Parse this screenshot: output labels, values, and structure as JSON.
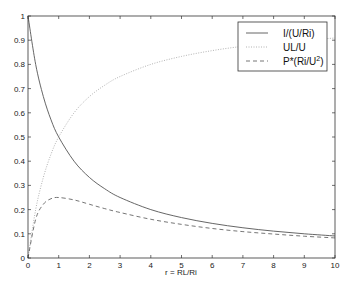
{
  "chart_data": {
    "type": "line",
    "title": "",
    "xlabel": "r = RL/Ri",
    "ylabel": "",
    "xlim": [
      0,
      10
    ],
    "ylim": [
      0,
      1
    ],
    "grid": false,
    "legend_position": "upper right",
    "x_ticks": [
      0,
      1,
      2,
      3,
      4,
      5,
      6,
      7,
      8,
      9,
      10
    ],
    "y_ticks": [
      0,
      0.1,
      0.2,
      0.3,
      0.4,
      0.5,
      0.6,
      0.7,
      0.8,
      0.9,
      1
    ],
    "x": [
      0,
      0.25,
      0.5,
      0.75,
      1,
      1.5,
      2,
      2.5,
      3,
      4,
      5,
      6,
      7,
      8,
      9,
      10
    ],
    "series": [
      {
        "name": "I/(U/Ri)",
        "style": "solid",
        "color": "#555555",
        "values": [
          1.0,
          0.8,
          0.667,
          0.571,
          0.5,
          0.4,
          0.333,
          0.286,
          0.25,
          0.2,
          0.167,
          0.143,
          0.125,
          0.111,
          0.1,
          0.091
        ]
      },
      {
        "name": "UL/U",
        "style": "dotted",
        "color": "#aaaaaa",
        "values": [
          0.0,
          0.2,
          0.333,
          0.429,
          0.5,
          0.6,
          0.667,
          0.714,
          0.75,
          0.8,
          0.833,
          0.857,
          0.875,
          0.889,
          0.9,
          0.909
        ]
      },
      {
        "name": "P*(Ri/U²)",
        "style": "dashed",
        "color": "#666666",
        "values": [
          0.0,
          0.16,
          0.222,
          0.245,
          0.25,
          0.24,
          0.222,
          0.204,
          0.188,
          0.16,
          0.139,
          0.122,
          0.109,
          0.099,
          0.09,
          0.083
        ]
      }
    ]
  },
  "legend": {
    "items": [
      {
        "label_main": "I/(U/Ri)",
        "label_sup": ""
      },
      {
        "label_main": "UL/U",
        "label_sup": ""
      },
      {
        "label_main": "P*(Ri/U",
        "label_sup": "2",
        "label_end": ")"
      }
    ]
  },
  "axes": {
    "xlabel": "r = RL/Ri"
  }
}
